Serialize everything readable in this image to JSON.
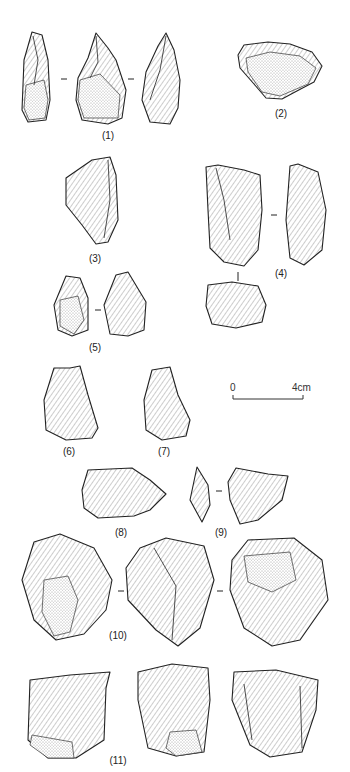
{
  "figure": {
    "items": [
      {
        "id": 1,
        "label": "(1)",
        "views": 3
      },
      {
        "id": 2,
        "label": "(2)",
        "views": 1
      },
      {
        "id": 3,
        "label": "(3)",
        "views": 1
      },
      {
        "id": 4,
        "label": "(4)",
        "views": 3
      },
      {
        "id": 5,
        "label": "(5)",
        "views": 2
      },
      {
        "id": 6,
        "label": "(6)",
        "views": 1
      },
      {
        "id": 7,
        "label": "(7)",
        "views": 1
      },
      {
        "id": 8,
        "label": "(8)",
        "views": 1
      },
      {
        "id": 9,
        "label": "(9)",
        "views": 2
      },
      {
        "id": 10,
        "label": "(10)",
        "views": 3
      },
      {
        "id": 11,
        "label": "(11)",
        "views": 3
      }
    ],
    "scale_bar": {
      "start_label": "0",
      "end_label": "4cm",
      "length_cm": 4
    },
    "colors": {
      "ink": "#222222",
      "background": "#ffffff"
    }
  }
}
